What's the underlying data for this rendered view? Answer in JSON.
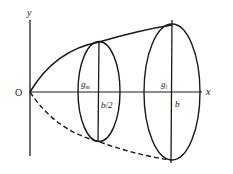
{
  "diagram": {
    "title": "",
    "labels": {
      "origin": "O",
      "x_axis": "x",
      "y_axis": "y",
      "g_m_main": "g",
      "g_m_sub": "m",
      "g_l_main": "g",
      "g_l_sub": "l",
      "half_b": "b/2",
      "b": "b"
    },
    "elements": {
      "axes": {
        "x_axis": "horizontal axis through O",
        "y_axis": "vertical axis through O"
      },
      "upper_curve": "solid parabola from O through top of section at b/2 to top of section at b",
      "lower_curve": "dashed mirror of parabola below x-axis",
      "small_ellipse": "cross-section at x = b/2 with vertical diameter",
      "large_ellipse": "cross-section at x = b with vertical diameter"
    },
    "colors": {
      "stroke": "#1a1a1a",
      "background": "#ffffff"
    }
  }
}
